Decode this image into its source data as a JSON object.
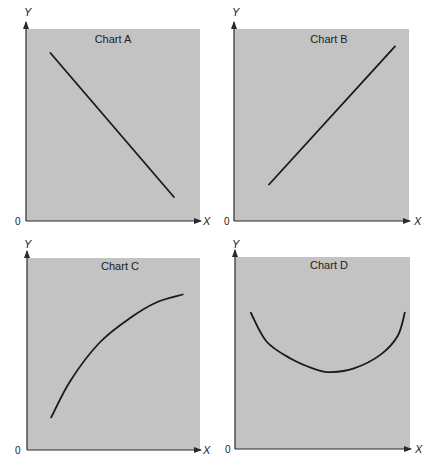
{
  "chart_data": [
    {
      "type": "line",
      "title": "Chart A",
      "xlabel": "X",
      "ylabel": "Y",
      "origin_label": "0",
      "xlim": [
        0,
        10
      ],
      "ylim": [
        0,
        10
      ],
      "grid": false,
      "shape": "straight line, negative slope",
      "series": [
        {
          "name": "A",
          "x": [
            1.4,
            8.5
          ],
          "y": [
            8.75,
            1.25
          ]
        }
      ]
    },
    {
      "type": "line",
      "title": "Chart B",
      "xlabel": "X",
      "ylabel": "Y",
      "origin_label": "0",
      "xlim": [
        0,
        10
      ],
      "ylim": [
        0,
        10
      ],
      "grid": false,
      "shape": "straight line, positive slope",
      "series": [
        {
          "name": "B",
          "x": [
            2.0,
            9.2
          ],
          "y": [
            1.9,
            9.1
          ]
        }
      ]
    },
    {
      "type": "line",
      "title": "Chart C",
      "xlabel": "X",
      "ylabel": "Y",
      "origin_label": "0",
      "xlim": [
        0,
        10
      ],
      "ylim": [
        0,
        10
      ],
      "grid": false,
      "shape": "increasing at a decreasing rate (concave)",
      "series": [
        {
          "name": "C",
          "x": [
            1.4,
            2.5,
            4.2,
            6.0,
            7.5,
            9.0
          ],
          "y": [
            1.7,
            3.6,
            5.6,
            6.9,
            7.7,
            8.1
          ]
        }
      ]
    },
    {
      "type": "line",
      "title": "Chart D",
      "xlabel": "X",
      "ylabel": "Y",
      "origin_label": "0",
      "xlim": [
        0,
        10
      ],
      "ylim": [
        0,
        10
      ],
      "grid": false,
      "shape": "U-shaped (decreasing then increasing)",
      "series": [
        {
          "name": "D",
          "x": [
            0.9,
            1.8,
            3.2,
            4.6,
            5.5,
            6.8,
            8.3,
            9.3,
            9.7
          ],
          "y": [
            7.1,
            5.6,
            4.7,
            4.15,
            4.0,
            4.2,
            4.9,
            5.9,
            7.1
          ]
        }
      ]
    }
  ],
  "colors": {
    "plot_background": "#c3c3c3",
    "line": "#1a1a1a",
    "axis": "#2a2a2a",
    "text": "#222222"
  }
}
